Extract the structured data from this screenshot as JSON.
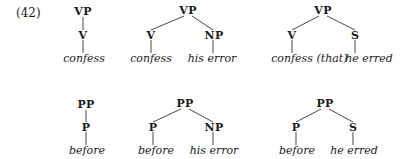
{
  "example_number": "(42)",
  "trees": [
    {
      "root": "VP",
      "children": [
        {
          "label": "V",
          "words": "confess"
        }
      ]
    },
    {
      "root": "VP",
      "children": [
        {
          "label": "V",
          "words": "confess"
        },
        {
          "label": "NP",
          "words": "his error"
        }
      ]
    },
    {
      "root": "VP",
      "children": [
        {
          "label": "V",
          "words": "confess"
        },
        {
          "label": "S",
          "words": "he erred",
          "prefix": "(that)"
        }
      ]
    },
    {
      "root": "PP",
      "children": [
        {
          "label": "P",
          "words": "before"
        }
      ]
    },
    {
      "root": "PP",
      "children": [
        {
          "label": "P",
          "words": "before"
        },
        {
          "label": "NP",
          "words": "his error"
        }
      ]
    },
    {
      "root": "PP",
      "children": [
        {
          "label": "P",
          "words": "before"
        },
        {
          "label": "S",
          "words": "he erred"
        }
      ]
    }
  ]
}
